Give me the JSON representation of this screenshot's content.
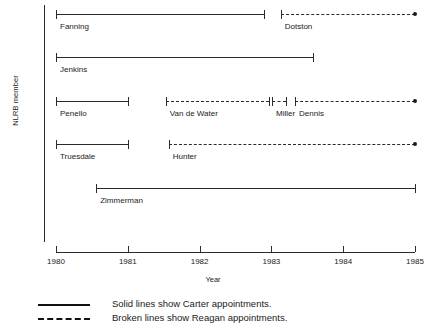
{
  "chart_data": {
    "type": "timeline",
    "title": "",
    "xlabel": "Year",
    "ylabel": "NLRB member",
    "xlim": [
      1980,
      1985
    ],
    "xticks": [
      1980,
      1981,
      1982,
      1983,
      1984,
      1985
    ],
    "xtick_labels": [
      "1980",
      "1981",
      "1982",
      "1983",
      "1984",
      "1985"
    ],
    "grid": false,
    "legend_position": "below-axis",
    "series": [
      {
        "name": "Carter appointments",
        "style": "solid",
        "legend_label": "Solid lines show Carter appointments."
      },
      {
        "name": "Reagan appointments",
        "style": "broken",
        "legend_label": "Broken lines show Reagan appointments."
      }
    ],
    "rows": [
      {
        "row": 1,
        "segments": [
          {
            "label": "Fanning",
            "style": "solid",
            "start": 1980.0,
            "end": 1982.9,
            "end_marker": "cap"
          },
          {
            "label": "Dotston",
            "style": "broken",
            "start": 1983.13,
            "end": 1985.0,
            "end_marker": "dot"
          }
        ]
      },
      {
        "row": 2,
        "segments": [
          {
            "label": "Jenkins",
            "style": "solid",
            "start": 1980.0,
            "end": 1983.58,
            "end_marker": "cap"
          }
        ]
      },
      {
        "row": 3,
        "segments": [
          {
            "label": "Penello",
            "style": "solid",
            "start": 1980.0,
            "end": 1981.0,
            "end_marker": "cap"
          },
          {
            "label": "Van de Water",
            "style": "broken",
            "start": 1981.53,
            "end": 1982.96,
            "end_marker": "cap"
          },
          {
            "label": "Miller",
            "style": "broken",
            "start": 1983.01,
            "end": 1983.21,
            "end_marker": "cap"
          },
          {
            "label": "Dennis",
            "style": "broken",
            "start": 1983.33,
            "end": 1985.0,
            "end_marker": "dot"
          }
        ]
      },
      {
        "row": 4,
        "segments": [
          {
            "label": "Truesdale",
            "style": "solid",
            "start": 1980.0,
            "end": 1981.0,
            "end_marker": "cap"
          },
          {
            "label": "Hunter",
            "style": "broken",
            "start": 1981.57,
            "end": 1985.0,
            "end_marker": "dot"
          }
        ]
      },
      {
        "row": 5,
        "segments": [
          {
            "label": "Zimmerman",
            "style": "solid",
            "start": 1980.56,
            "end": 1985.0,
            "end_marker": "cap"
          }
        ]
      }
    ]
  },
  "axis": {
    "y_title": "NLRB member",
    "x_title": "Year",
    "ticks": [
      "1980",
      "1981",
      "1982",
      "1983",
      "1984",
      "1985"
    ]
  },
  "legend": {
    "items": [
      {
        "style": "solid",
        "text": "Solid lines show Carter appointments."
      },
      {
        "style": "broken",
        "text": "Broken lines show Reagan appointments."
      }
    ]
  },
  "colors": {
    "ink": "#2b2b2b",
    "background": "#ffffff"
  }
}
